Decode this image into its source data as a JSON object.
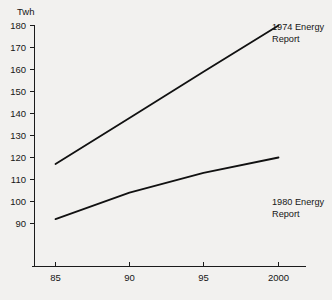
{
  "chart_data": {
    "type": "line",
    "title": "",
    "xlabel": "",
    "ylabel": "Twh",
    "ylim": [
      85,
      183
    ],
    "xlim": [
      83.5,
      2001.5
    ],
    "grid": false,
    "legend_position": "inline-annotation",
    "x": [
      "85",
      "90",
      "95",
      "2000"
    ],
    "x_values": [
      85,
      90,
      95,
      2000
    ],
    "y_ticks": [
      90,
      100,
      110,
      120,
      130,
      140,
      150,
      160,
      170,
      180
    ],
    "y_tick_labels": [
      "90",
      "100",
      "110",
      "120",
      "130",
      "140",
      "150",
      "160",
      "170",
      "180"
    ],
    "series": [
      {
        "name": "1974 Energy Report",
        "values": [
          117,
          138,
          159,
          180
        ],
        "annotation": {
          "line1": "1974 Energy",
          "line2": "Report"
        }
      },
      {
        "name": "1980 Energy Report",
        "values": [
          92,
          104,
          113,
          120
        ],
        "annotation": {
          "line1": "1980 Energy",
          "line2": "Report"
        }
      }
    ]
  },
  "axes": {
    "y_axis_title": "Twh",
    "y_tick_labels": [
      "180",
      "170",
      "160",
      "150",
      "140",
      "130",
      "120",
      "110",
      "100",
      "90"
    ],
    "x_tick_labels": [
      "85",
      "90",
      "95",
      "2000"
    ]
  },
  "annotations": {
    "series1_line1": "1974 Energy",
    "series1_line2": "Report",
    "series2_line1": "1980 Energy",
    "series2_line2": "Report"
  },
  "colors": {
    "background": "#f2f1ef",
    "ink": "#161616",
    "series": "#111111"
  }
}
